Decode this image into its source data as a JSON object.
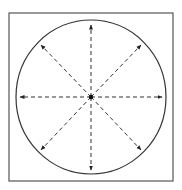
{
  "diagram": {
    "type": "radial-arrows-in-circle",
    "frame": {
      "x": 9,
      "y": 13,
      "width": 164,
      "height": 168,
      "stroke": "#555555"
    },
    "circle": {
      "cx": 91,
      "cy": 97,
      "rx": 75,
      "ry": 77,
      "stroke": "#333333"
    },
    "center_dot": {
      "cx": 91,
      "cy": 97,
      "r": 2.2,
      "fill": "#111111"
    },
    "arrows": [
      {
        "direction": "up",
        "x2": 91,
        "y2": 25
      },
      {
        "direction": "up-right",
        "x2": 141,
        "y2": 45
      },
      {
        "direction": "right",
        "x2": 162,
        "y2": 97
      },
      {
        "direction": "down-right",
        "x2": 141,
        "y2": 150
      },
      {
        "direction": "down",
        "x2": 91,
        "y2": 170
      },
      {
        "direction": "down-left",
        "x2": 41,
        "y2": 150
      },
      {
        "direction": "left",
        "x2": 20,
        "y2": 97
      },
      {
        "direction": "up-left",
        "x2": 41,
        "y2": 45
      }
    ],
    "arrow_style": {
      "stroke": "#333333",
      "dash": "4 3"
    }
  }
}
